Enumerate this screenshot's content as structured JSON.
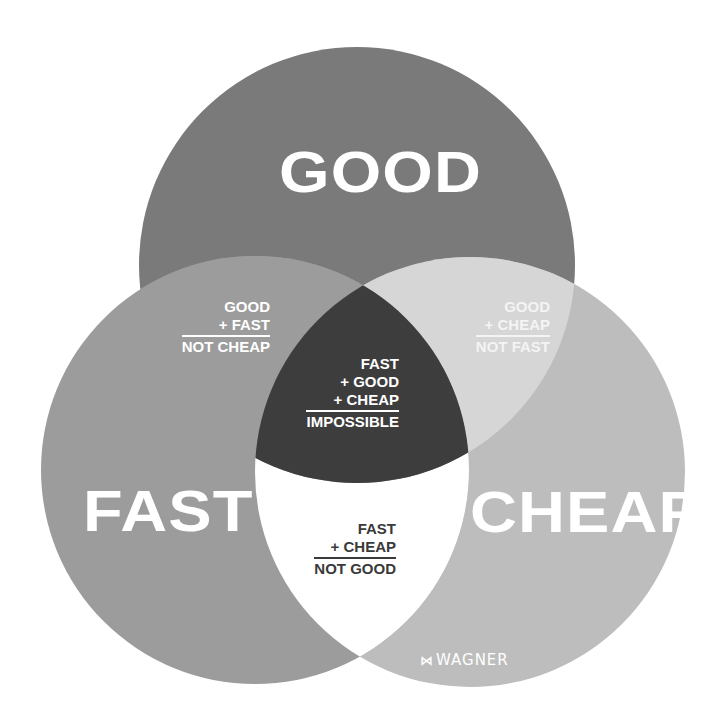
{
  "diagram": {
    "type": "venn",
    "circles": [
      {
        "id": "good",
        "label": "GOOD",
        "cx": 357,
        "cy": 265,
        "r": 218,
        "color": "#7a7a7a"
      },
      {
        "id": "fast",
        "label": "FAST",
        "cx": 255,
        "cy": 470,
        "r": 214,
        "color": "#9c9c9c"
      },
      {
        "id": "cheap",
        "label": "CHEAP",
        "cx": 470,
        "cy": 472,
        "r": 215,
        "color": "#bdbdbd"
      }
    ],
    "regions": {
      "good_fast": {
        "color": "#9c9c9c"
      },
      "good_cheap": {
        "color": "#d6d6d6"
      },
      "fast_cheap": {
        "color": "#ffffff"
      },
      "all_three": {
        "color": "#3d3d3d"
      }
    }
  },
  "labels": {
    "good": "GOOD",
    "fast": "FAST",
    "cheap": "CHEAP"
  },
  "combos": {
    "good_fast": {
      "lines": [
        "GOOD",
        "+ FAST"
      ],
      "result": "NOT CHEAP"
    },
    "good_cheap": {
      "lines": [
        "GOOD",
        "+ CHEAP"
      ],
      "result": "NOT FAST"
    },
    "all_three": {
      "lines": [
        "FAST",
        "+ GOOD",
        "+ CHEAP"
      ],
      "result": "IMPOSSIBLE"
    },
    "fast_cheap": {
      "lines": [
        "FAST",
        "+ CHEAP"
      ],
      "result": "NOT GOOD"
    }
  },
  "logo": {
    "mark": "⋈",
    "text": "WAGNER"
  }
}
